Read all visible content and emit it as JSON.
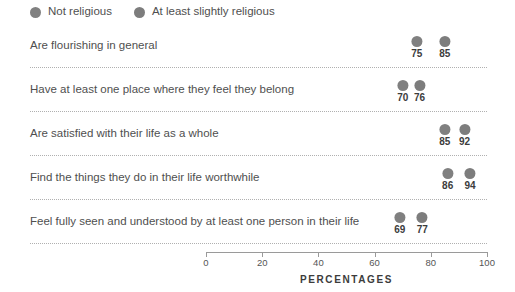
{
  "chart_data": {
    "type": "scatter",
    "title": "",
    "xlabel": "PERCENTAGES",
    "ylabel": "",
    "xlim": [
      0,
      100
    ],
    "xticks": [
      0,
      20,
      40,
      60,
      80,
      100
    ],
    "grid": false,
    "legend_position": "top-left",
    "categories": [
      "Are flourishing in general",
      "Have at least one place where they feel they belong",
      "Are satisfied with their life as a whole",
      "Find the things they do in their life worthwhile",
      "Feel fully seen and understood by at least one person in their life"
    ],
    "series": [
      {
        "name": "Not religious",
        "color": "#808080",
        "values": [
          75,
          70,
          85,
          86,
          69
        ]
      },
      {
        "name": "At least slightly religious",
        "color": "#7d7d7d",
        "values": [
          85,
          76,
          92,
          94,
          77
        ]
      }
    ]
  },
  "legend": {
    "items": [
      {
        "label": "Not religious",
        "color": "#808080",
        "dot_name": "legend-dot-not-religious"
      },
      {
        "label": "At least slightly religious",
        "color": "#7d7d7d",
        "dot_name": "legend-dot-at-least-slightly-religious"
      }
    ]
  },
  "axis": {
    "title": "PERCENTAGES",
    "ticks": [
      "0",
      "20",
      "40",
      "60",
      "80",
      "100"
    ]
  },
  "colors": {
    "background": "#ffffff",
    "label_text": "#4f4f4f",
    "value_text": "#3c3c3c",
    "divider": "#b0b0b0",
    "axis": "#9a9a9a"
  }
}
